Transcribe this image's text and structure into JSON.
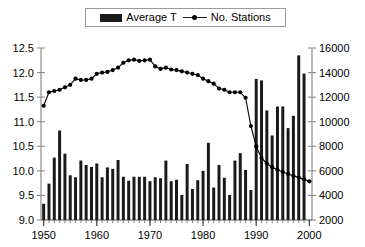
{
  "legend": {
    "position": "top-center",
    "entries": [
      {
        "label": "Average T",
        "marker": "bar-swatch-icon"
      },
      {
        "label": "No. Stations",
        "marker": "line-marker-icon"
      }
    ]
  },
  "chart_data": {
    "type": "bar",
    "title": "",
    "subtitle": "",
    "xlabel": "",
    "ylabel": "",
    "y2label": "",
    "grid": false,
    "legend_position": "top-center",
    "xlim": [
      1949.5,
      2000.5
    ],
    "ylim": [
      9.0,
      12.5
    ],
    "y2lim": [
      2000,
      16000
    ],
    "x_tick_labels": [
      "1950",
      "1960",
      "1970",
      "1980",
      "1990",
      "2000"
    ],
    "x_tick_values": [
      1950,
      1960,
      1970,
      1980,
      1990,
      2000
    ],
    "y_tick_labels": [
      "9.0",
      "9.5",
      "10.0",
      "10.5",
      "11.0",
      "11.5",
      "12.0",
      "12.5"
    ],
    "y_tick_values": [
      9.0,
      9.5,
      10.0,
      10.5,
      11.0,
      11.5,
      12.0,
      12.5
    ],
    "y2_tick_labels": [
      "2000",
      "4000",
      "6000",
      "8000",
      "10000",
      "12000",
      "14000",
      "16000"
    ],
    "y2_tick_values": [
      2000,
      4000,
      6000,
      8000,
      10000,
      12000,
      14000,
      16000
    ],
    "categories": [
      1950,
      1951,
      1952,
      1953,
      1954,
      1955,
      1956,
      1957,
      1958,
      1959,
      1960,
      1961,
      1962,
      1963,
      1964,
      1965,
      1966,
      1967,
      1968,
      1969,
      1970,
      1971,
      1972,
      1973,
      1974,
      1975,
      1976,
      1977,
      1978,
      1979,
      1980,
      1981,
      1982,
      1983,
      1984,
      1985,
      1986,
      1987,
      1988,
      1989,
      1990,
      1991,
      1992,
      1993,
      1994,
      1995,
      1996,
      1997,
      1998,
      1999,
      2000
    ],
    "series": [
      {
        "name": "Average T",
        "axis": "left",
        "type": "bar",
        "color": "#1a1a1a",
        "values": [
          9.33,
          9.74,
          10.27,
          10.82,
          10.35,
          9.91,
          9.87,
          10.21,
          10.12,
          10.08,
          10.15,
          9.87,
          10.07,
          10.04,
          10.22,
          9.88,
          9.8,
          9.88,
          9.88,
          9.88,
          9.79,
          9.87,
          9.85,
          10.21,
          9.79,
          9.82,
          9.51,
          10.14,
          9.63,
          9.81,
          10.0,
          10.57,
          9.66,
          10.12,
          9.86,
          9.51,
          10.21,
          10.36,
          10.02,
          9.61,
          11.87,
          11.84,
          11.23,
          10.72,
          11.31,
          11.31,
          10.87,
          11.12,
          12.35,
          11.98,
          9.0
        ]
      },
      {
        "name": "No. Stations",
        "axis": "right",
        "type": "line",
        "color": "#000000",
        "values": [
          11300,
          12400,
          12500,
          12600,
          12800,
          13000,
          13500,
          13400,
          13400,
          13500,
          13900,
          14000,
          14050,
          14200,
          14400,
          14800,
          15000,
          15050,
          14950,
          15000,
          15050,
          14500,
          14300,
          14400,
          14250,
          14200,
          14100,
          14000,
          13900,
          13800,
          13500,
          13300,
          13100,
          12700,
          12600,
          12400,
          12400,
          12400,
          11950,
          9650,
          8000,
          7050,
          6600,
          6300,
          6100,
          5900,
          5750,
          5600,
          5450,
          5300,
          5150
        ]
      }
    ]
  }
}
